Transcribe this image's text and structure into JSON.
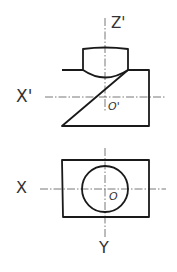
{
  "drawing": {
    "type": "orthographic projection sketch",
    "front_view": {
      "vertical_axis_label": "Z'",
      "horizontal_axis_label": "X'",
      "origin_label": "O'"
    },
    "top_view": {
      "horizontal_axis_label": "X",
      "vertical_axis_label": "Y",
      "origin_label": "O"
    },
    "colors": {
      "line": "#1a1a1a",
      "centerline": "#555555",
      "background": "#ffffff"
    }
  }
}
